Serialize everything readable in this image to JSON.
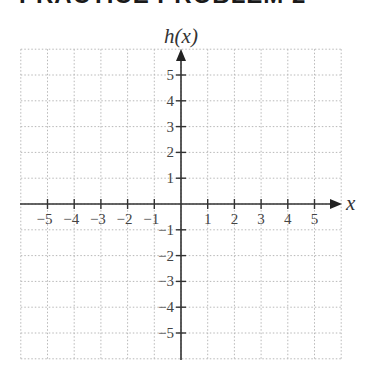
{
  "header": {
    "title": "PRACTICE PROBLEM 2"
  },
  "chart_data": {
    "type": "scatter",
    "title": "PRACTICE PROBLEM 2",
    "xlabel": "x",
    "ylabel": "h(x)",
    "xlim": [
      -6,
      6
    ],
    "ylim": [
      -6,
      6
    ],
    "grid": true,
    "grid_style": "dotted",
    "x_ticks": [
      -5,
      -4,
      -3,
      -2,
      -1,
      1,
      2,
      3,
      4,
      5
    ],
    "y_ticks": [
      5,
      4,
      3,
      2,
      1,
      -1,
      -2,
      -3,
      -4,
      -5
    ],
    "x_tick_labels": [
      "−5",
      "−4",
      "−3",
      "−2",
      "−1",
      "1",
      "2",
      "3",
      "4",
      "5"
    ],
    "y_tick_labels": [
      "5",
      "4",
      "3",
      "2",
      "1",
      "−1",
      "−2",
      "−3",
      "−4",
      "−5"
    ],
    "series": [],
    "colors": {
      "axis": "#333333",
      "grid": "#b8b8b8",
      "text": "#444444"
    }
  }
}
